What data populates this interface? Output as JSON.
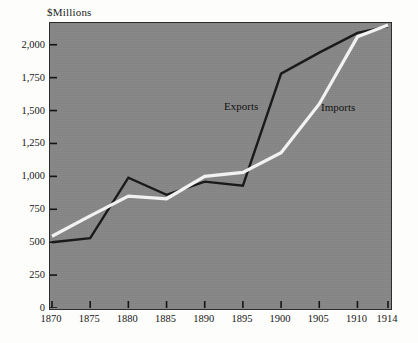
{
  "chart_data": {
    "type": "line",
    "title": "",
    "xlabel": "",
    "ylabel": "$Millions",
    "x": [
      1870,
      1875,
      1880,
      1885,
      1890,
      1895,
      1900,
      1905,
      1910,
      1914
    ],
    "xlim": [
      1870,
      1914
    ],
    "ylim": [
      0,
      2150
    ],
    "grid": false,
    "legend_position": "inline-annotations",
    "xticks": [
      "1870",
      "1875",
      "1880",
      "1885",
      "1890",
      "1895",
      "1900",
      "1905",
      "1910",
      "1914"
    ],
    "yticks": [
      "0",
      "250",
      "500",
      "750",
      "1,000",
      "1,250",
      "1,500",
      "1,750",
      "2,000"
    ],
    "ytick_values": [
      0,
      250,
      500,
      750,
      1000,
      1250,
      1500,
      1750,
      2000
    ],
    "series": [
      {
        "name": "Exports",
        "color": "#1a1a1a",
        "values": [
          500,
          530,
          990,
          860,
          960,
          930,
          1780,
          1940,
          2090,
          2140
        ]
      },
      {
        "name": "Imports",
        "color": "#f2f2f2",
        "values": [
          545,
          700,
          850,
          830,
          1000,
          1030,
          1180,
          1550,
          2060,
          2150
        ]
      }
    ],
    "annotations": [
      {
        "text": "Exports",
        "series": "Exports"
      },
      {
        "text": "Imports",
        "series": "Imports"
      }
    ],
    "plot_background": "#878787",
    "axis_color": "#2b2b2b"
  }
}
